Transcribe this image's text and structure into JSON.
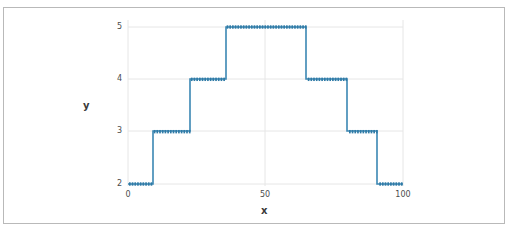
{
  "figure": {
    "border_color": "#b9b9b9",
    "background": "#ffffff"
  },
  "chart_data": {
    "type": "line",
    "style": "step-post",
    "title": "",
    "xlabel": "x",
    "ylabel": "y",
    "xlim": [
      0,
      100
    ],
    "ylim": [
      2,
      5
    ],
    "xticks": [
      0,
      50,
      100
    ],
    "xtick_labels": [
      "0",
      "50",
      "100"
    ],
    "yticks": [
      2,
      3,
      4,
      5
    ],
    "ytick_labels": [
      "2",
      "3",
      "4",
      "5"
    ],
    "grid": true,
    "legend": null,
    "line_color": "#3b87b3",
    "marker": "square",
    "series": [
      {
        "name": "step",
        "x": [
          0,
          9,
          9,
          22.5,
          22.5,
          35.5,
          35.5,
          65,
          65,
          80,
          80,
          91,
          91,
          100
        ],
        "y": [
          2,
          2,
          3,
          3,
          4,
          4,
          5,
          5,
          4,
          4,
          3,
          3,
          2,
          2
        ]
      }
    ],
    "steps": [
      {
        "x_start": 0,
        "x_end": 9,
        "y": 2
      },
      {
        "x_start": 9,
        "x_end": 22.5,
        "y": 3
      },
      {
        "x_start": 22.5,
        "x_end": 35.5,
        "y": 4
      },
      {
        "x_start": 35.5,
        "x_end": 65,
        "y": 5
      },
      {
        "x_start": 65,
        "x_end": 80,
        "y": 4
      },
      {
        "x_start": 80,
        "x_end": 91,
        "y": 3
      },
      {
        "x_start": 91,
        "x_end": 100,
        "y": 2
      }
    ]
  }
}
